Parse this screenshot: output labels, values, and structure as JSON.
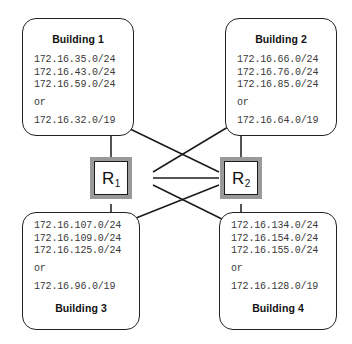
{
  "diagram": {
    "accent_border": "#222222",
    "router_shadow": "#9a9a9a",
    "text_color": "#3a3a3a"
  },
  "buildings": [
    {
      "id": "building-1",
      "title": "Building 1",
      "title_position": "top",
      "subnets": [
        "172.16.35.0/24",
        "172.16.43.0/24",
        "172.16.59.0/24"
      ],
      "connector": "or",
      "summary": "172.16.32.0/19"
    },
    {
      "id": "building-2",
      "title": "Building 2",
      "title_position": "top",
      "subnets": [
        "172.16.66.0/24",
        "172.16.76.0/24",
        "172.16.85.0/24"
      ],
      "connector": "or",
      "summary": "172.16.64.0/19"
    },
    {
      "id": "building-3",
      "title": "Building 3",
      "title_position": "bottom",
      "subnets": [
        "172.16.107.0/24",
        "172.16.109.0/24",
        "172.16.125.0/24"
      ],
      "connector": "or",
      "summary": "172.16.96.0/19"
    },
    {
      "id": "building-4",
      "title": "Building 4",
      "title_position": "bottom",
      "subnets": [
        "172.16.134.0/24",
        "172.16.154.0/24",
        "172.16.155.0/24"
      ],
      "connector": "or",
      "summary": "172.16.128.0/19"
    }
  ],
  "routers": [
    {
      "id": "router-1",
      "name": "R",
      "subscript": "1",
      "full_label": "R1"
    },
    {
      "id": "router-2",
      "name": "R",
      "subscript": "2",
      "full_label": "R2"
    }
  ],
  "links": [
    {
      "from": "router-1",
      "to": "building-1",
      "style": "vertical"
    },
    {
      "from": "router-1",
      "to": "building-2",
      "style": "diagonal"
    },
    {
      "from": "router-1",
      "to": "building-3",
      "style": "vertical"
    },
    {
      "from": "router-1",
      "to": "building-4",
      "style": "diagonal"
    },
    {
      "from": "router-2",
      "to": "building-1",
      "style": "diagonal"
    },
    {
      "from": "router-2",
      "to": "building-2",
      "style": "vertical"
    },
    {
      "from": "router-2",
      "to": "building-3",
      "style": "diagonal"
    },
    {
      "from": "router-2",
      "to": "building-4",
      "style": "vertical"
    },
    {
      "from": "router-1",
      "to": "router-2",
      "style": "horizontal"
    }
  ]
}
